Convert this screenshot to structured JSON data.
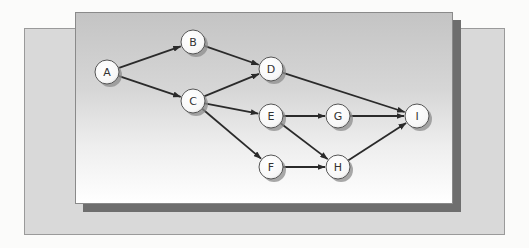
{
  "diagram": {
    "type": "directed-graph",
    "nodes": [
      {
        "id": "A",
        "label": "A",
        "x": 107,
        "y": 72
      },
      {
        "id": "B",
        "label": "B",
        "x": 193,
        "y": 42
      },
      {
        "id": "C",
        "label": "C",
        "x": 193,
        "y": 101
      },
      {
        "id": "D",
        "label": "D",
        "x": 271,
        "y": 69
      },
      {
        "id": "E",
        "label": "E",
        "x": 271,
        "y": 116
      },
      {
        "id": "F",
        "label": "F",
        "x": 271,
        "y": 167
      },
      {
        "id": "G",
        "label": "G",
        "x": 338,
        "y": 116
      },
      {
        "id": "H",
        "label": "H",
        "x": 338,
        "y": 167
      },
      {
        "id": "I",
        "label": "I",
        "x": 417,
        "y": 116
      }
    ],
    "edges": [
      {
        "from": "A",
        "to": "B"
      },
      {
        "from": "A",
        "to": "C"
      },
      {
        "from": "B",
        "to": "D"
      },
      {
        "from": "C",
        "to": "D"
      },
      {
        "from": "C",
        "to": "E"
      },
      {
        "from": "C",
        "to": "F"
      },
      {
        "from": "D",
        "to": "I"
      },
      {
        "from": "E",
        "to": "G"
      },
      {
        "from": "E",
        "to": "H"
      },
      {
        "from": "F",
        "to": "H"
      },
      {
        "from": "G",
        "to": "I"
      },
      {
        "from": "H",
        "to": "I"
      }
    ],
    "node_radius": 12,
    "colors": {
      "node_fill": "#ffffff",
      "node_stroke": "#555555",
      "node_shadow": "#8c8c8c",
      "edge": "#2a2a2a",
      "front_panel_top": "#c4c4c4",
      "front_panel_bottom": "#ffffff",
      "back_panel": "#d9d9d9",
      "panel_shadow": "#6e6e6e"
    }
  }
}
